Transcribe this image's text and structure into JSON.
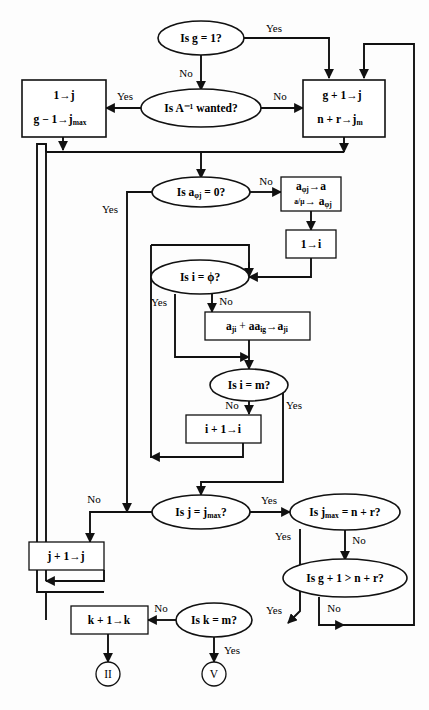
{
  "figure": {
    "type": "flowchart",
    "background_color": "#fdfdfd",
    "line_color": "#111111",
    "shape_fill": "#ffffff"
  },
  "nodes": {
    "d_g_eq_1": {
      "label": "Is g = 1?",
      "shape": "decision"
    },
    "d_ainv_wanted": {
      "label": "Is A⁻¹ wanted?",
      "shape": "decision"
    },
    "p_set_j_jmax": {
      "shape": "process",
      "line1": "1→j",
      "line2": "g − 1→j",
      "line2_sub": "max"
    },
    "p_g_plus_1": {
      "shape": "process",
      "line1": "g + 1→j",
      "line2": "n + r→j",
      "line2_sub": "m"
    },
    "d_aphij_eq_0": {
      "label": "Is a",
      "label_sub": "φj",
      "label_tail": " = 0?",
      "shape": "decision"
    },
    "p_aphij_swap": {
      "shape": "process",
      "line1_a": "a",
      "line1_sub": "φj",
      "line1_b": "→a",
      "line2_num": "a",
      "line2_den": "μ",
      "line2_b": "→ a",
      "line2_sub": "φj"
    },
    "p_set_i_1": {
      "shape": "process",
      "line1": "1→i"
    },
    "d_i_eq_phi": {
      "label": "Is i = ϕ?",
      "shape": "decision"
    },
    "p_aji_update": {
      "shape": "process",
      "t1": "a",
      "t1_sub": "ji",
      "t2": " + ",
      "t3": "aa",
      "t3_sub": "ig",
      "t4": "→a",
      "t4_sub": "ji"
    },
    "d_i_eq_m": {
      "label": "Is i = m?",
      "shape": "decision"
    },
    "p_i_inc": {
      "shape": "process",
      "line1": "i + 1→i"
    },
    "d_j_eq_jmax": {
      "label_a": "Is j = j",
      "label_sub": "max",
      "label_tail": "?",
      "shape": "decision"
    },
    "d_jmax_eq_n_r": {
      "label_a": "Is j",
      "label_sub": "max",
      "label_tail": " = n + r?",
      "shape": "decision"
    },
    "d_g1_gt_n_r": {
      "label": "Is g + 1 > n + r?",
      "shape": "decision"
    },
    "p_j_inc": {
      "shape": "process",
      "line1": "j + 1→j"
    },
    "d_k_eq_m": {
      "label": "Is k = m?",
      "shape": "decision"
    },
    "p_k_inc": {
      "shape": "process",
      "line1": "k + 1→k"
    },
    "term_II": {
      "label": "II",
      "shape": "terminator"
    },
    "term_V": {
      "label": "V",
      "shape": "terminator"
    }
  },
  "edge_labels": {
    "yes_g_eq_1": "Yes",
    "no_g_eq_1": "No",
    "yes_ainv": "Yes",
    "no_ainv": "No",
    "yes_aphij": "Yes",
    "no_aphij": "No",
    "yes_i_phi": "Yes",
    "no_i_phi": "No",
    "no_i_m": "No",
    "yes_i_m": "Yes",
    "no_j_jmax": "No",
    "yes_j_jmax": "Yes",
    "yes_jmax_nr": "Yes",
    "no_jmax_nr": "No",
    "no_g1_nr": "No",
    "yes_k_m": "Yes",
    "no_k_m": "No",
    "yes_k_m_2": "Yes"
  }
}
